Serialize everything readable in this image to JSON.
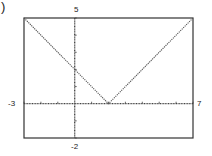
{
  "part_label": ")",
  "window": {
    "xmin": "-3",
    "xmax": "7",
    "ymin": "-2",
    "ymax": "5"
  },
  "colors": {
    "frame": "#333333",
    "axis": "#444444",
    "curve": "#555555",
    "background": "#ffffff"
  },
  "chart_data": {
    "type": "line",
    "title": "",
    "function": "y = |x - 2|",
    "xlabel": "",
    "ylabel": "",
    "xlim": [
      -3,
      7
    ],
    "ylim": [
      -2,
      5
    ],
    "xscale": 1,
    "yscale": 1,
    "grid": false,
    "style": "dotted (graphing calculator)",
    "tick_labels": {
      "xmin": "-3",
      "xmax": "7",
      "ymin": "-2",
      "ymax": "5"
    },
    "series": [
      {
        "name": "y = |x - 2|",
        "x": [
          -3,
          -2,
          -1,
          0,
          1,
          2,
          3,
          4,
          5,
          6,
          7
        ],
        "y": [
          5,
          4,
          3,
          2,
          1,
          0,
          1,
          2,
          3,
          4,
          5
        ]
      }
    ],
    "vertex": {
      "x": 2,
      "y": 0
    }
  }
}
